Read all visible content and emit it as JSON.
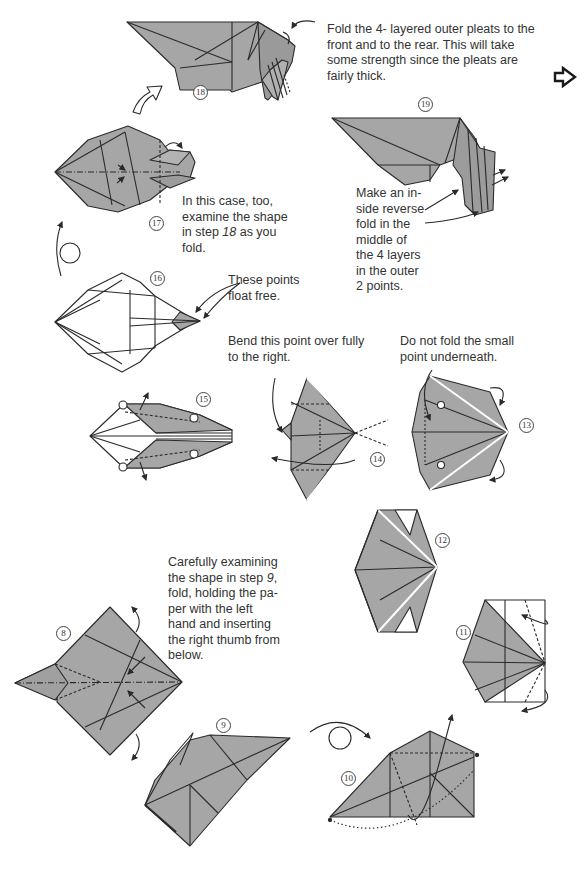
{
  "page": {
    "type": "origami instruction diagram page",
    "paper_color": "#a6a6a6",
    "line_color": "#2a2a2a"
  },
  "steps": [
    {
      "number": "8",
      "glyph": "⑧"
    },
    {
      "number": "9",
      "glyph": "⑨"
    },
    {
      "number": "10",
      "glyph": "⑩"
    },
    {
      "number": "11",
      "glyph": "⑪"
    },
    {
      "number": "12",
      "glyph": "⑫"
    },
    {
      "number": "13",
      "glyph": "⑬"
    },
    {
      "number": "14",
      "glyph": "⑭"
    },
    {
      "number": "15",
      "glyph": "⑮"
    },
    {
      "number": "16",
      "glyph": "⑯"
    },
    {
      "number": "17",
      "glyph": "⑰"
    },
    {
      "number": "18",
      "glyph": "⑱"
    },
    {
      "number": "19",
      "glyph": "⑲"
    }
  ],
  "notes": {
    "step18": "Fold the 4- layered outer pleats to the\nfront and to the rear. This will take\nsome strength since the pleats are\nfairly thick.",
    "step19": "Make an in-\nside reverse\nfold in the\nmiddle of\nthe 4 layers\nin the outer\n2 points.",
    "step17_pre": "In this case, too,\nexamine the shape\nin step ",
    "step17_ref": "18",
    "step17_post": " as you\nfold.",
    "step16": "These points\nfloat free.",
    "step14": "Bend this point over fully\nto the right.",
    "step13": "Do not fold the small\npoint underneath.",
    "step8_pre": "Carefully examining\nthe shape in step ",
    "step8_ref": "9",
    "step8_post": ",\nfold, holding the pa-\nper with the left\nhand and inserting\nthe right thumb from\nbelow."
  },
  "navigation": {
    "next_page_icon": "hollow-right-arrow"
  }
}
